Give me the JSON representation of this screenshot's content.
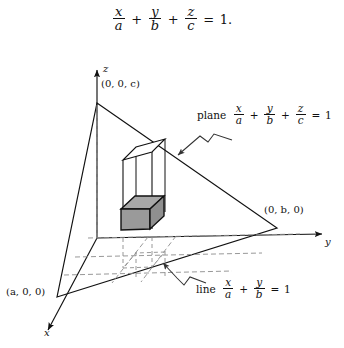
{
  "figure": {
    "name": "plane-intercept-3d-diagram",
    "background_color": "#ffffff",
    "ink_color": "#111111",
    "shaded_box_fill": "#9e9e9e",
    "dashed_line_color": "#8c8c8c"
  },
  "equation": {
    "display": {
      "terms": [
        {
          "num": "x",
          "den": "a"
        },
        {
          "num": "y",
          "den": "b"
        },
        {
          "num": "z",
          "den": "c"
        }
      ],
      "plus": "+",
      "equals": "=",
      "rhs": "1",
      "period": ".",
      "plain_text": "x/a + y/b + z/c = 1."
    }
  },
  "annotations": {
    "plane": {
      "word": "plane",
      "terms": [
        {
          "num": "x",
          "den": "a"
        },
        {
          "num": "y",
          "den": "b"
        },
        {
          "num": "z",
          "den": "c"
        }
      ],
      "plus": "+",
      "equals": "=",
      "rhs": "1",
      "plain_text": "plane x/a + y/b + z/c = 1"
    },
    "line": {
      "word": "line",
      "terms": [
        {
          "num": "x",
          "den": "a"
        },
        {
          "num": "y",
          "den": "b"
        }
      ],
      "plus": "+",
      "equals": "=",
      "rhs": "1",
      "plain_text": "line x/a + y/b = 1"
    }
  },
  "axes": {
    "x": {
      "label": "x"
    },
    "y": {
      "label": "y"
    },
    "z": {
      "label": "z"
    }
  },
  "points": {
    "a_intercept": {
      "label": "(a, 0, 0)",
      "open": "(",
      "close": ")",
      "comma": ", ",
      "coords": [
        "a",
        "0",
        "0"
      ]
    },
    "b_intercept": {
      "label": "(0, b, 0)",
      "open": "(",
      "close": ")",
      "comma": ", ",
      "coords": [
        "0",
        "b",
        "0"
      ]
    },
    "c_intercept": {
      "label": "(0, 0, c)",
      "open": "(",
      "close": ")",
      "comma": ", ",
      "coords": [
        "0",
        "0",
        "c"
      ]
    }
  }
}
